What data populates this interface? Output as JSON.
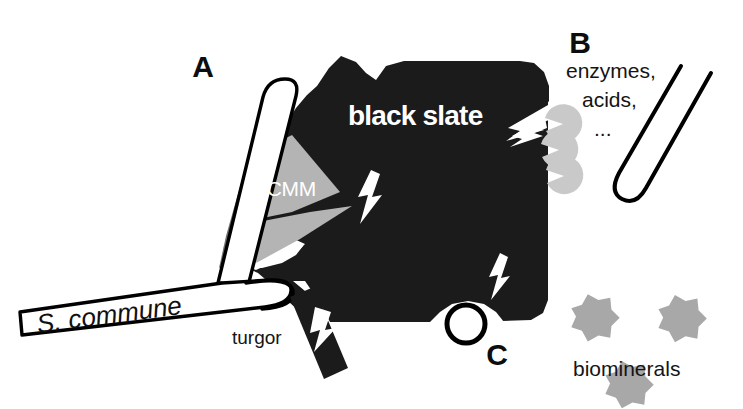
{
  "figure": {
    "background_color": "#ffffff"
  },
  "panels": [
    {
      "id": "A",
      "letter": "A",
      "caption": "mechanical penetration by hypha with ECMM and turgor"
    },
    {
      "id": "B",
      "letter": "B",
      "caption": "chemical attack by enzymes and acids"
    },
    {
      "id": "C",
      "letter": "C",
      "caption": "biomineral formation"
    }
  ],
  "labels": {
    "panel_a": "A",
    "panel_b": "B",
    "panel_c": "C",
    "species": "S. commune",
    "substrate": "black slate",
    "matrix": "ECMM",
    "turgor": "turgor",
    "enzymes": "enzymes,",
    "acids": "acids,",
    "ellipsis": "...",
    "biominerals": "biominerals"
  },
  "elements": {
    "hypha_left": {
      "name": "fungal hypha of S. commune (panel A)",
      "fill": "#ffffff",
      "stroke": "#000000"
    },
    "hypha_right": {
      "name": "fungal hypha releasing enzymes (panel B)",
      "fill": "#ffffff",
      "stroke": "#000000"
    },
    "slate": {
      "name": "black slate rock fragment",
      "fill": "#1b1b1b"
    },
    "ecmm_dark": {
      "name": "extracellular mucilaginous matrix, dark wedge",
      "fill": "#6f6f6f"
    },
    "ecmm_light": {
      "name": "extracellular mucilaginous matrix, light wedge",
      "fill": "#b4b4b4"
    },
    "enzyme_particles": {
      "name": "secreted enzyme particles",
      "fill": "#c9c9c9",
      "count": 3
    },
    "biominerals": {
      "name": "biomineral star crystals",
      "fill": "#a8a8a8",
      "count": 3
    },
    "turgor_bar": {
      "name": "turgor pressure force bar",
      "fill": "#1b1b1b"
    },
    "lightning_bolts": {
      "name": "white lightning bolt action markers",
      "fill": "#ffffff",
      "count": 4
    },
    "vesicle_circle": {
      "name": "vesicle ring at slate edge",
      "fill": "#ffffff",
      "stroke": "#000000"
    }
  },
  "colors": {
    "slate_black": "#1b1b1b",
    "ecmm_dark_gray": "#6f6f6f",
    "ecmm_light_gray": "#b4b4b4",
    "enzyme_gray": "#c9c9c9",
    "biomineral_gray": "#a8a8a8",
    "outline_black": "#000000",
    "paper_white": "#ffffff"
  }
}
